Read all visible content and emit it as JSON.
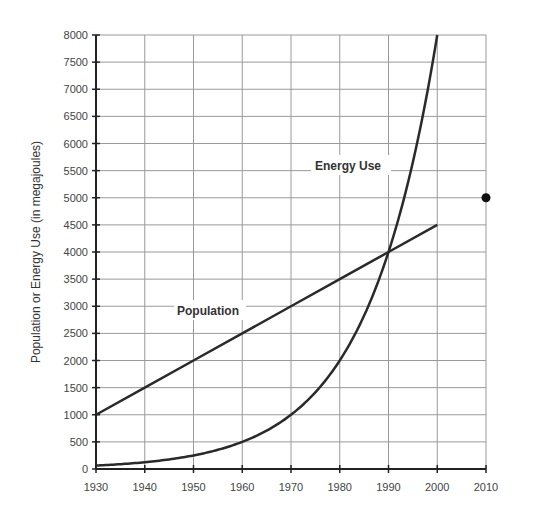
{
  "chart_data": {
    "type": "line",
    "title": "",
    "xlabel": "",
    "ylabel": "Population or  Energy Use (in megajoules)",
    "x": [
      1930,
      1940,
      1950,
      1960,
      1970,
      1980,
      1990,
      2000
    ],
    "x_ticks": [
      1930,
      1940,
      1950,
      1960,
      1970,
      1980,
      1990,
      2000,
      2010
    ],
    "y_ticks": [
      0,
      500,
      1000,
      1500,
      2000,
      2500,
      3000,
      3500,
      4000,
      4500,
      5000,
      5500,
      6000,
      6500,
      7000,
      7500,
      8000
    ],
    "xlim": [
      1930,
      2010
    ],
    "ylim": [
      0,
      8000
    ],
    "grid": true,
    "legend": "inline labels",
    "series": [
      {
        "name": "Population",
        "values": [
          1000,
          1500,
          2000,
          2500,
          3000,
          3500,
          4000,
          4500
        ]
      },
      {
        "name": "Energy Use",
        "values": [
          62.5,
          125,
          250,
          500,
          1000,
          2000,
          4000,
          8000
        ]
      }
    ],
    "annotations": [
      {
        "type": "point",
        "x": 2010,
        "y": 5000
      }
    ]
  },
  "labels": {
    "population": "Population",
    "energy": "Energy Use",
    "ylabel": "Population or  Energy Use (in megajoules)"
  }
}
